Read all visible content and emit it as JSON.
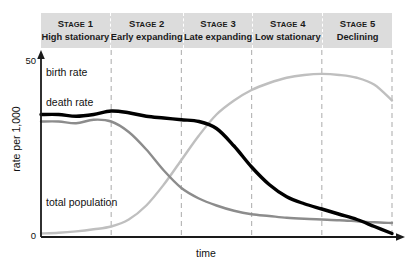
{
  "chart_data": {
    "type": "line",
    "xlabel": "time",
    "ylabel": "rate per 1,000",
    "ylim": [
      0,
      50
    ],
    "y_ticks": [
      "0",
      "50"
    ],
    "grid": false,
    "legend_position": "inline-labels",
    "x_axis_arrow": true,
    "y_axis_arrow": true,
    "stages": [
      {
        "number": "Stage 1",
        "name": "High stationary",
        "x_start": 0,
        "x_end": 20
      },
      {
        "number": "Stage 2",
        "name": "Early expanding",
        "x_start": 20,
        "x_end": 40
      },
      {
        "number": "Stage 3",
        "name": "Late expanding",
        "x_start": 40,
        "x_end": 60
      },
      {
        "number": "Stage 4",
        "name": "Low stationary",
        "x_start": 60,
        "x_end": 80
      },
      {
        "number": "Stage 5",
        "name": "Declining",
        "x_start": 80,
        "x_end": 100
      }
    ],
    "x": [
      0,
      5,
      10,
      15,
      20,
      25,
      30,
      35,
      40,
      45,
      50,
      55,
      60,
      65,
      70,
      75,
      80,
      85,
      90,
      95,
      100
    ],
    "series": [
      {
        "name": "birth rate",
        "color": "#000000",
        "width": 3.4,
        "values": [
          35,
          35,
          34.5,
          35,
          36,
          35.5,
          34.5,
          34,
          33.5,
          33,
          31,
          26,
          20,
          15,
          11.5,
          9.5,
          8,
          6.5,
          5,
          3,
          1
        ]
      },
      {
        "name": "death rate",
        "color": "#8c8c8c",
        "width": 2.4,
        "values": [
          33,
          33,
          32.5,
          33.5,
          33,
          30,
          25,
          19,
          14,
          11,
          9,
          7.5,
          6.5,
          6,
          5.5,
          5.2,
          5,
          4.8,
          4.5,
          4.2,
          4
        ]
      },
      {
        "name": "total population",
        "color": "#bfbfbf",
        "width": 2.4,
        "values": [
          1,
          1.2,
          1.6,
          2.2,
          3,
          5,
          9,
          15,
          22,
          29,
          35,
          39,
          42,
          44,
          45.5,
          46.3,
          46.6,
          46.3,
          45.5,
          43.5,
          39
        ]
      }
    ]
  },
  "labels": {
    "birth_rate": "birth rate",
    "death_rate": "death rate",
    "total_population": "total population",
    "ylabel": "rate per 1,000",
    "xlabel": "time",
    "tick_top": "50",
    "tick_bottom": "0"
  },
  "colors": {
    "band_background": "#dcdcdc",
    "band_divider": "#ffffff",
    "plot_divider": "#b8b8b8",
    "axis": "#1a1a1a",
    "birth_rate": "#000000",
    "death_rate": "#8c8c8c",
    "total_population": "#bfbfbf",
    "text": "#1a1a1a",
    "background": "#ffffff"
  }
}
